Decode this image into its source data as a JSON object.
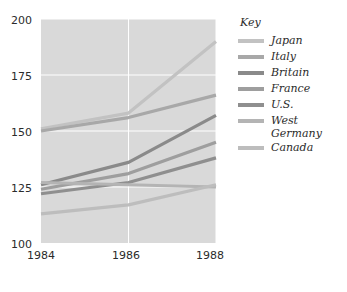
{
  "chart_data": {
    "type": "line",
    "title": "",
    "xlabel": "",
    "ylabel": "",
    "x": [
      1984,
      1986,
      1988
    ],
    "xtick_labels": [
      "1984",
      "1986",
      "1988"
    ],
    "ytick_labels": [
      "100",
      "125",
      "150",
      "175",
      "200"
    ],
    "yticks": [
      100,
      125,
      150,
      175,
      200
    ],
    "xlim": [
      1984,
      1988
    ],
    "ylim": [
      100,
      200
    ],
    "grid": true,
    "legend_position": "right",
    "legend_title": "Key",
    "plot_background": "#d9d9d9",
    "grid_color": "#ffffff",
    "series": [
      {
        "name": "Japan",
        "values": [
          151,
          158,
          190
        ],
        "color": "#c2c2c2"
      },
      {
        "name": "Italy",
        "values": [
          150,
          156,
          166
        ],
        "color": "#a8a8a8"
      },
      {
        "name": "Britain",
        "values": [
          126,
          136,
          157
        ],
        "color": "#8a8a8a"
      },
      {
        "name": "France",
        "values": [
          124,
          131,
          145
        ],
        "color": "#9e9e9e"
      },
      {
        "name": "U.S.",
        "values": [
          122,
          127,
          138
        ],
        "color": "#8f8f8f"
      },
      {
        "name": "West Germany",
        "values": [
          127,
          126,
          125
        ],
        "color": "#b4b4b4"
      },
      {
        "name": "Canada",
        "values": [
          113,
          117,
          126
        ],
        "color": "#bdbdbd"
      }
    ]
  },
  "legend": {
    "title": "Key",
    "items": [
      {
        "label": "Japan"
      },
      {
        "label": "Italy"
      },
      {
        "label": "Britain"
      },
      {
        "label": "France"
      },
      {
        "label": "U.S."
      },
      {
        "label": "West Germany"
      },
      {
        "label": "Canada"
      }
    ]
  },
  "axes": {
    "y_labels": [
      "200",
      "175",
      "150",
      "125",
      "100"
    ],
    "x_labels": [
      "1984",
      "1986",
      "1988"
    ]
  }
}
